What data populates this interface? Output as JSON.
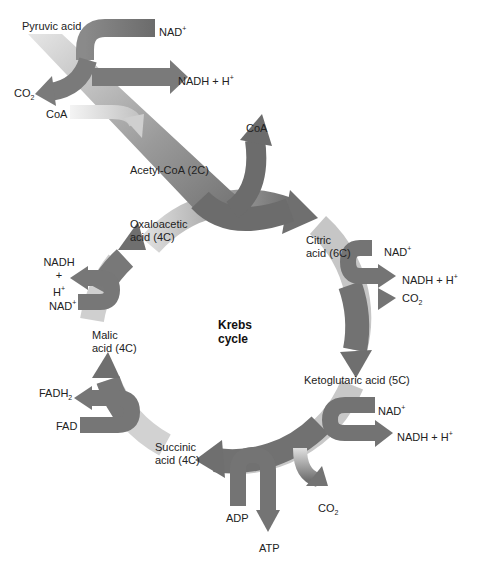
{
  "colors": {
    "arrow_dark": "#6f6f6f",
    "arrow_mid": "#8a8a8a",
    "arrow_light": "#d8d8d8",
    "text": "#222222",
    "background": "#ffffff"
  },
  "center_label": {
    "line1": "Krebs",
    "line2": "cycle"
  },
  "entry": {
    "pyruvic_acid": "Pyruvic acid",
    "nad_plus": "NAD",
    "nad_plus_sup": "+",
    "nadh": "NADH + H",
    "nadh_sup": "+",
    "co2": "CO",
    "co2_sub": "2",
    "coa_in": "CoA",
    "acetyl_coa": "Acetyl-CoA (2C)",
    "coa_out": "CoA"
  },
  "cycle_intermediates": {
    "citric_line1": "Citric",
    "citric_line2": "acid (6C)",
    "ketoglutaric": "Ketoglutaric acid (5C)",
    "succinic_line1": "Succinic",
    "succinic_line2": "acid (4C)",
    "malic_line1": "Malic",
    "malic_line2": "acid (4C)",
    "oxaloacetic_line1": "Oxaloacetic",
    "oxaloacetic_line2": "acid (4C)"
  },
  "side_reactions": {
    "citric_nad": "NAD",
    "citric_nadh": "NADH + H",
    "citric_co2": "CO",
    "keto_nad": "NAD",
    "keto_nadh": "NADH + H",
    "keto_co2": "CO",
    "succ_adp": "ADP",
    "succ_atp": "ATP",
    "malic_fad": "FAD",
    "malic_fadh2": "FADH",
    "oxalo_nad": "NAD",
    "oxalo_nadh_line1": "NADH",
    "oxalo_nadh_line2": "+",
    "oxalo_nadh_line3": "H",
    "plus": "+",
    "two": "2"
  }
}
